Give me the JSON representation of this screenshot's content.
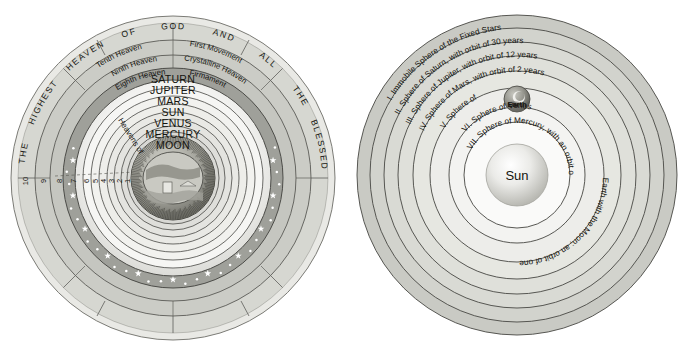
{
  "figure": {
    "kind": "two-cosmology-diagrams",
    "background": "#ffffff"
  },
  "palette": {
    "outer_ring": "#cfd0cb",
    "mid_ring": "#c2c3bd",
    "star_ring": "#9fa09a",
    "planet_ring_light": "#f4f4f2",
    "planet_ring_mid": "#e6e6e3",
    "stroke": "#4c4c48",
    "star_color": "#ffffff",
    "earth_globe": "#9a9a93",
    "sun_body": "#d3d3cf",
    "text": "#14140f"
  },
  "left": {
    "name": "ptolemaic-geocentric-universe",
    "outer_band_words": [
      "THE",
      "HIGHEST",
      "HEAVEN",
      "OF",
      "GOD",
      "AND",
      "ALL",
      "THE",
      "BLESSED"
    ],
    "named_heavens": [
      "Tenth Heaven",
      "First Movement",
      "Ninth Heaven",
      "Crystalline Heaven",
      "Eighth Heaven",
      "Firmament"
    ],
    "heavens_of_label": "Heavens of",
    "planets": [
      "SATURN",
      "JUPITER",
      "MARS",
      "SUN",
      "VENUS",
      "MERCURY",
      "MOON"
    ],
    "ring_numbers": [
      "10",
      "9",
      "8",
      "7",
      "6",
      "5",
      "4",
      "3",
      "2",
      "1"
    ],
    "center": "earth-landscape-vignette"
  },
  "right": {
    "name": "copernican-heliocentric-universe",
    "spheres": [
      "I. Immobile Sphere of the Fixed Stars",
      "II. Sphere of Saturn, with orbit of 30 years",
      "III. Sphere of Jupiter, with orbit of 12 years",
      "IV. Sphere of Mars, with orbit of 2 years",
      "V. Sphere of",
      "Earth with the Moon; an orbit of one year",
      "VI. Sphere of Venus",
      "VII. Sphere of Mercury, with an orbit of 30 years"
    ],
    "earth_label": "Earth",
    "sun_label": "Sun"
  }
}
